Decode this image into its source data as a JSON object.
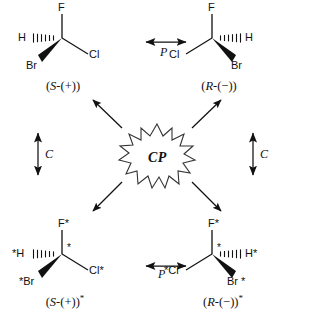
{
  "diagram": {
    "center": {
      "label": "CP",
      "shape": "starburst"
    },
    "operations": {
      "parity_label": "P",
      "conjugation_label": "C"
    },
    "molecules": [
      {
        "id": "top-left",
        "caption_stereo": "S",
        "caption_rotation": "-(+)",
        "caption_star": "",
        "carbon_star": "",
        "atoms": {
          "top": "F",
          "left": "H",
          "lower_left": "Br",
          "right": "Cl"
        }
      },
      {
        "id": "top-right",
        "caption_stereo": "R",
        "caption_rotation": "-(−)",
        "caption_star": "",
        "carbon_star": "",
        "atoms": {
          "top": "F",
          "left": "Cl",
          "lower_right": "Br",
          "right": "H"
        }
      },
      {
        "id": "bottom-left",
        "caption_stereo": "S",
        "caption_rotation": "-(+)",
        "caption_star": "*",
        "carbon_star": "*",
        "atoms": {
          "top": "F*",
          "left": "*H",
          "lower_left": "*Br",
          "right": "Cl*"
        }
      },
      {
        "id": "bottom-right",
        "caption_stereo": "R",
        "caption_rotation": "-(−)",
        "caption_star": "*",
        "carbon_star": "*",
        "atoms": {
          "top": "F*",
          "left": "*Cl",
          "lower_right": "Br *",
          "right": "H*"
        }
      }
    ],
    "colors": {
      "ink": "#111111",
      "background": "#ffffff"
    }
  }
}
